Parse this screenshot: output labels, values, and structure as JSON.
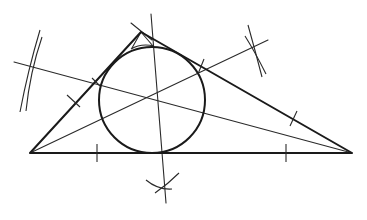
{
  "diagram": {
    "colors": {
      "stroke": "#1a1a1a",
      "background": "#ffffff"
    },
    "triangle": {
      "vertices": {
        "A": [
          30,
          153
        ],
        "B": [
          352,
          153
        ],
        "C": [
          141,
          32
        ]
      }
    },
    "incircle": {
      "center": [
        152,
        100
      ],
      "radius": 53
    },
    "angle_bisectors": [
      {
        "from": "A",
        "line": [
          [
            30,
            153
          ],
          [
            268,
            40
          ]
        ]
      },
      {
        "from": "B",
        "line": [
          [
            352,
            153
          ],
          [
            14,
            62
          ]
        ]
      },
      {
        "from": "C",
        "line": [
          [
            141,
            32
          ],
          [
            166,
            203
          ]
        ]
      }
    ],
    "construction_marks": {
      "left_arcs_center": [
        30,
        64
      ],
      "right_arcs_center": [
        257,
        52
      ],
      "bottom_arcs_center": [
        164,
        188
      ],
      "top_cross_center": [
        141,
        32
      ]
    },
    "tick_marks": [
      {
        "position": [
          97,
          153
        ],
        "on": "base"
      },
      {
        "position": [
          286,
          153
        ],
        "on": "base"
      },
      {
        "position": [
          73,
          101
        ],
        "on": "side-AC"
      },
      {
        "position": [
          293,
          119
        ],
        "on": "side-BC"
      },
      {
        "position": [
          201,
          67
        ],
        "on": "side-BC"
      }
    ]
  }
}
